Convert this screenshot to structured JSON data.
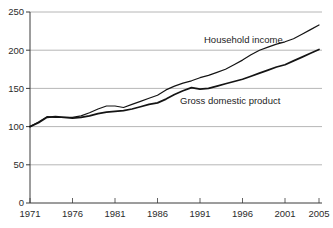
{
  "chart_data": {
    "type": "line",
    "title": "",
    "xlabel": "",
    "ylabel": "",
    "xlim": [
      1971,
      2005
    ],
    "ylim": [
      0,
      250
    ],
    "grid": "horizontal",
    "legend_position": "inline-labels",
    "x_ticks": [
      1971,
      1976,
      1981,
      1986,
      1991,
      1996,
      2001,
      2005
    ],
    "y_ticks": [
      0,
      50,
      100,
      150,
      200,
      250
    ],
    "x": [
      1971,
      1972,
      1973,
      1974,
      1975,
      1976,
      1977,
      1978,
      1979,
      1980,
      1981,
      1982,
      1983,
      1984,
      1985,
      1986,
      1987,
      1988,
      1989,
      1990,
      1991,
      1992,
      1993,
      1994,
      1995,
      1996,
      1997,
      1998,
      1999,
      2000,
      2001,
      2002,
      2003,
      2004,
      2005
    ],
    "series": [
      {
        "name": "Household income",
        "values": [
          100,
          106,
          113,
          112,
          112,
          112,
          114,
          118,
          123,
          127,
          127,
          125,
          129,
          133,
          137,
          141,
          148,
          153,
          157,
          160,
          164,
          167,
          171,
          175,
          181,
          187,
          194,
          200,
          204,
          208,
          211,
          215,
          221,
          227,
          233
        ]
      },
      {
        "name": "Gross domestic product",
        "values": [
          100,
          105,
          112,
          113,
          112,
          111,
          112,
          114,
          117,
          119,
          120,
          121,
          123,
          126,
          129,
          131,
          136,
          142,
          147,
          151,
          149,
          150,
          153,
          156,
          159,
          162,
          166,
          170,
          174,
          178,
          181,
          186,
          191,
          196,
          201
        ]
      }
    ],
    "colors": {
      "line": "#141414",
      "grid": "#a3a3a3",
      "axis": "#3a3a3a",
      "text": "#2b2b2b"
    }
  }
}
